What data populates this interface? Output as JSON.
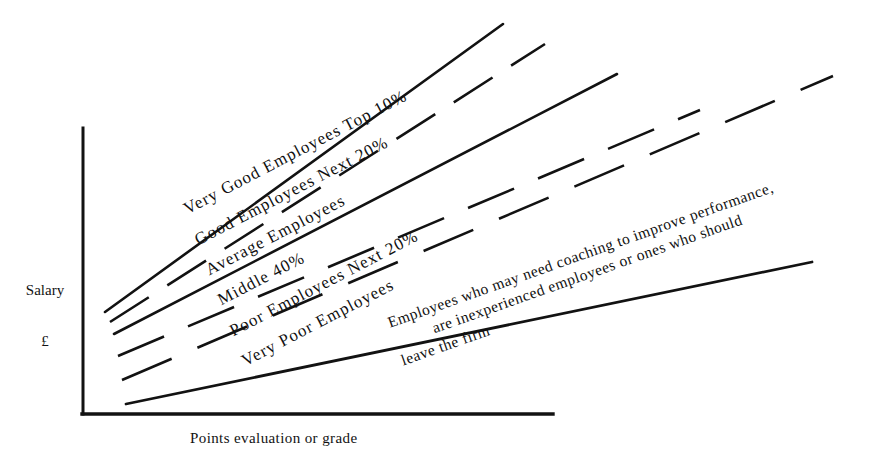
{
  "figure": {
    "title": "",
    "axes": {
      "y_label_line1": "Salary",
      "y_label_line2": "£",
      "x_label": "Points evaluation or grade"
    },
    "annotation": {
      "line1": "Employees who may need coaching to improve performance,",
      "line2": "are inexperienced employees or  ones who should",
      "line3": "leave the firm"
    },
    "band_labels": {
      "very_good": "Very Good Employees Top 10%",
      "good": "Good Employees Next 20%",
      "average": "Average Employees",
      "middle": "Middle 40%",
      "poor": "Poor Employees Next 20%",
      "very_poor": "Very Poor Employees"
    },
    "colors": {
      "ink": "#121212",
      "background": "#ffffff"
    }
  },
  "chart_data": {
    "type": "line",
    "title": "",
    "xlabel": "Points evaluation or grade",
    "ylabel": "Salary £",
    "xlim": [
      0,
      100
    ],
    "ylim": [
      0,
      100
    ],
    "grid": false,
    "legend_position": "inline-along-lines",
    "axis_ticks": {
      "x": [],
      "y": []
    },
    "note": "Schematic salary-range fan: six boundary lines radiate from low points/low salary to high points/high salary, delimiting performance bands.",
    "series": [
      {
        "name": "Very Good Employees Top 10%",
        "style": "solid",
        "x": [
          6,
          100
        ],
        "y": [
          36,
          97
        ],
        "px": {
          "x1": 105,
          "y1": 312,
          "x2": 503,
          "y2": 24
        }
      },
      {
        "name": "Good Employees Next 20%",
        "style": "dashed",
        "x": [
          7,
          100
        ],
        "y": [
          32,
          88
        ],
        "px": {
          "x1": 110,
          "y1": 322,
          "x2": 545,
          "y2": 44
        }
      },
      {
        "name": "Average Employees",
        "style": "solid",
        "x": [
          8,
          100
        ],
        "y": [
          27,
          80
        ],
        "px": {
          "x1": 114,
          "y1": 334,
          "x2": 617,
          "y2": 74
        }
      },
      {
        "name": "Middle 40%",
        "style": "dashed",
        "x": [
          9,
          100
        ],
        "y": [
          20,
          72
        ],
        "px": {
          "x1": 118,
          "y1": 356,
          "x2": 700,
          "y2": 110
        }
      },
      {
        "name": "Poor Employees Next 20%",
        "style": "dashed",
        "x": [
          10,
          100
        ],
        "y": [
          13,
          62
        ],
        "px": {
          "x1": 122,
          "y1": 380,
          "x2": 833,
          "y2": 76
        }
      },
      {
        "name": "Very Poor Employees",
        "style": "solid",
        "x": [
          11,
          100
        ],
        "y": [
          6,
          42
        ],
        "px": {
          "x1": 126,
          "y1": 404,
          "x2": 812,
          "y2": 262
        }
      }
    ],
    "bands": [
      "Very Good Employees Top 10%",
      "Good Employees Next 20%",
      "Average Employees",
      "Middle 40%",
      "Poor Employees Next 20%",
      "Very Poor Employees"
    ]
  }
}
